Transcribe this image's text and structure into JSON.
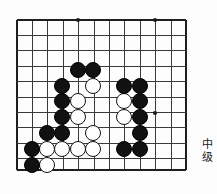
{
  "board": {
    "type": "go-board-diagram",
    "game": "go",
    "origin_x": 17,
    "origin_y": 20,
    "spacing": 15.4,
    "cols": 12,
    "rows": 10,
    "bottom_edge_y": 170,
    "right_edge_x": 186,
    "line_color": "#3a3a3a",
    "edge_color": "#1e1e1e",
    "background": "#fdfdfd",
    "star_points": [
      {
        "x": 78,
        "y": 20
      },
      {
        "x": 155,
        "y": 20
      },
      {
        "x": 155,
        "y": 113
      }
    ],
    "star_radius": 2.1
  },
  "stones": {
    "black_color": "#111111",
    "white_color": "#ffffff",
    "white_border": "#141414",
    "radius": 8.2,
    "black": [
      {
        "x": 78,
        "y": 70
      },
      {
        "x": 93,
        "y": 70
      },
      {
        "x": 62,
        "y": 86
      },
      {
        "x": 124,
        "y": 86
      },
      {
        "x": 140,
        "y": 86
      },
      {
        "x": 62,
        "y": 101
      },
      {
        "x": 140,
        "y": 101
      },
      {
        "x": 62,
        "y": 117
      },
      {
        "x": 140,
        "y": 117
      },
      {
        "x": 47,
        "y": 133
      },
      {
        "x": 62,
        "y": 133
      },
      {
        "x": 140,
        "y": 133
      },
      {
        "x": 32,
        "y": 149
      },
      {
        "x": 124,
        "y": 149
      },
      {
        "x": 140,
        "y": 149
      },
      {
        "x": 32,
        "y": 165
      }
    ],
    "white": [
      {
        "x": 93,
        "y": 86
      },
      {
        "x": 78,
        "y": 101
      },
      {
        "x": 124,
        "y": 101
      },
      {
        "x": 78,
        "y": 117
      },
      {
        "x": 124,
        "y": 117
      },
      {
        "x": 93,
        "y": 133
      },
      {
        "x": 47,
        "y": 149
      },
      {
        "x": 62,
        "y": 149
      },
      {
        "x": 78,
        "y": 149
      },
      {
        "x": 93,
        "y": 149
      },
      {
        "x": 47,
        "y": 165
      }
    ]
  },
  "caption": {
    "line1": "中",
    "line2": "级"
  }
}
